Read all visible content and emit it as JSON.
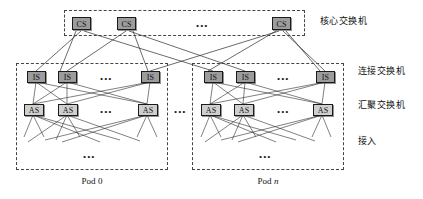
{
  "figure": {
    "type": "network-topology-diagram"
  },
  "core": {
    "container_name": "core-switch-group",
    "nodes": [
      {
        "label": "CS",
        "x": 72,
        "y": 17
      },
      {
        "label": "CS",
        "x": 117,
        "y": 17
      },
      {
        "label": "CS",
        "x": 272,
        "y": 17
      }
    ],
    "ellipsis": "•••"
  },
  "pods": [
    {
      "name": "pod-0",
      "label_prefix": "Pod ",
      "label_index": "0",
      "label_italic": false,
      "is_nodes": [
        {
          "label": "IS",
          "x": 27,
          "y": 71
        },
        {
          "label": "IS",
          "x": 58,
          "y": 71
        },
        {
          "label": "IS",
          "x": 141,
          "y": 71
        }
      ],
      "is_ellipsis": "•••",
      "as_nodes": [
        {
          "label": "AS",
          "x": 24,
          "y": 104
        },
        {
          "label": "AS",
          "x": 58,
          "y": 104
        },
        {
          "label": "AS",
          "x": 138,
          "y": 104
        }
      ],
      "as_ellipsis": "•••",
      "access_ellipsis": "•••"
    },
    {
      "name": "pod-n",
      "label_prefix": "Pod ",
      "label_index": "n",
      "label_italic": true,
      "is_nodes": [
        {
          "label": "IS",
          "x": 204,
          "y": 71
        },
        {
          "label": "IS",
          "x": 236,
          "y": 71
        },
        {
          "label": "IS",
          "x": 316,
          "y": 71
        }
      ],
      "is_ellipsis": "•••",
      "as_nodes": [
        {
          "label": "AS",
          "x": 201,
          "y": 104
        },
        {
          "label": "AS",
          "x": 234,
          "y": 104
        },
        {
          "label": "AS",
          "x": 313,
          "y": 104
        }
      ],
      "as_ellipsis": "•••",
      "access_ellipsis": "•••"
    }
  ],
  "between_pods_ellipsis": "•••",
  "tier_labels": [
    {
      "name": "tier-label-core",
      "text": "核心交换机",
      "x": 320,
      "y": 17
    },
    {
      "name": "tier-label-connection",
      "text": "连接交换机",
      "x": 358,
      "y": 66
    },
    {
      "name": "tier-label-aggregation",
      "text": "汇聚交换机",
      "x": 358,
      "y": 100
    },
    {
      "name": "tier-label-access",
      "text": "接入",
      "x": 358,
      "y": 136
    }
  ],
  "colors": {
    "node_fill_dark": "#9c9c9c",
    "node_fill_light": "#cfcfcf",
    "node_border": "#1b1b1b",
    "dashed_border": "#444444",
    "link": "#2b2b2b",
    "background": "#ffffff"
  }
}
